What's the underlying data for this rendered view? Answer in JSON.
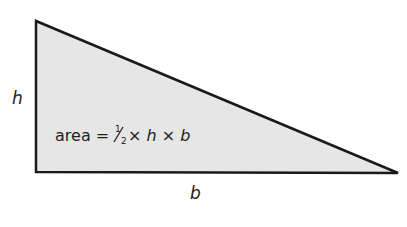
{
  "diagram": {
    "type": "right-triangle",
    "vertices": {
      "top_left": [
        36,
        21
      ],
      "bottom_left": [
        36,
        172
      ],
      "bottom_right": [
        398,
        173
      ]
    },
    "fill_color": "#e6e6e6",
    "stroke_color": "#1a1a1a",
    "labels": {
      "height": "h",
      "base": "b"
    },
    "formula": {
      "prefix": "area = ",
      "fraction_num": "1",
      "fraction_den": "2",
      "times1": " × ",
      "var_h": "h",
      "times2": " × ",
      "var_b": "b"
    }
  }
}
